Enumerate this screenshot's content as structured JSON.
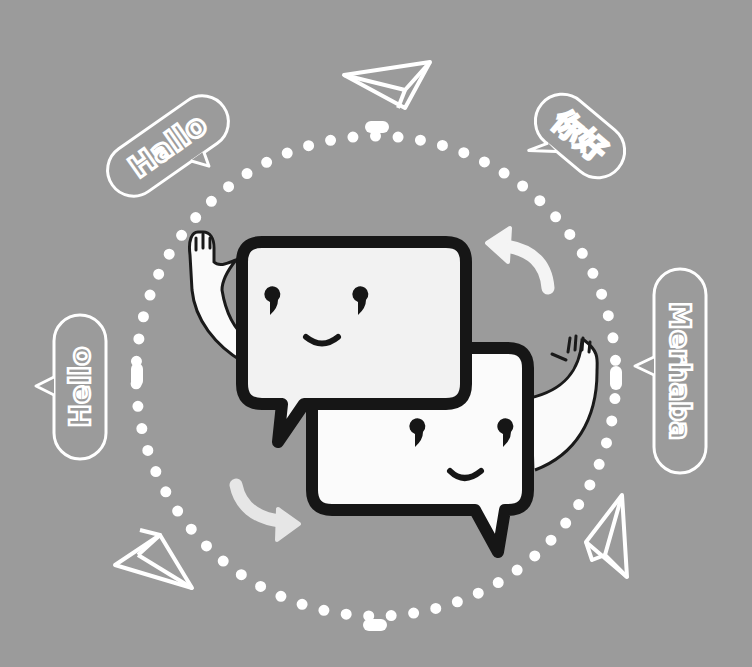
{
  "illustration": {
    "theme": "translation-chat",
    "background_color": "#9b9b9b",
    "line_color": "#ffffff",
    "outline_color": "#1a1a1a",
    "bubbles": [
      {
        "id": "hallo",
        "text": "Hallo",
        "language": "German"
      },
      {
        "id": "nihao",
        "text": "你好",
        "language": "Chinese"
      },
      {
        "id": "merhaba",
        "text": "Merhaba",
        "language": "Turkish"
      },
      {
        "id": "hello",
        "text": "Hello",
        "language": "English"
      }
    ],
    "icons": [
      "paper-plane-icon",
      "paper-plane-icon",
      "paper-plane-icon",
      "curved-arrow-icon",
      "curved-arrow-icon"
    ],
    "characters": [
      "chat-bubble-character-left",
      "chat-bubble-character-right"
    ]
  }
}
